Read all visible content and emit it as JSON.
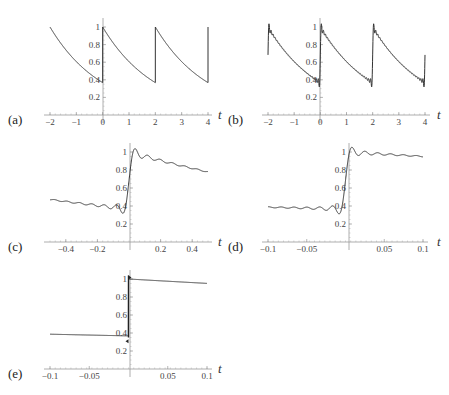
{
  "chart_data": [
    {
      "id": "a",
      "panel_label": "(a)",
      "type": "line",
      "title": "",
      "xlabel": "t",
      "ylabel": "",
      "xlim": [
        -2,
        4
      ],
      "ylim": [
        0,
        1.05
      ],
      "x_ticks": [
        "-2",
        "-1",
        "0",
        "1",
        "2",
        "3",
        "4"
      ],
      "y_ticks": [
        "0.2",
        "0.4",
        "0.6",
        "0.8",
        "1"
      ],
      "grid": false,
      "description": "Periodic sawtooth, period 2: y = exp(-(t mod 2)/2), jumps from ~0.37 to 1 at t=0 and t=2",
      "series": [
        {
          "name": "exact",
          "points": [
            [
              -2,
              1
            ],
            [
              -1,
              0.61
            ],
            [
              0,
              0.37
            ],
            [
              0,
              1
            ],
            [
              1,
              0.61
            ],
            [
              2,
              0.37
            ],
            [
              2,
              1
            ],
            [
              3,
              0.61
            ],
            [
              4,
              0.37
            ]
          ]
        }
      ]
    },
    {
      "id": "b",
      "panel_label": "(b)",
      "type": "line",
      "title": "",
      "xlabel": "t",
      "ylabel": "",
      "xlim": [
        -2,
        4
      ],
      "ylim": [
        0,
        1.05
      ],
      "x_ticks": [
        "-2",
        "-1",
        "0",
        "1",
        "2",
        "3",
        "4"
      ],
      "y_ticks": [
        "0.2",
        "0.4",
        "0.6",
        "0.8",
        "1"
      ],
      "grid": false,
      "description": "Fourier partial-sum approximation of (a) with Gibbs ringing near jumps; endpoints at t=-2 and t=4 near 0.68",
      "series": [
        {
          "name": "fourier",
          "points": [
            [
              -2,
              0.68
            ],
            [
              -1.95,
              1.03
            ],
            [
              -1,
              0.61
            ],
            [
              -0.05,
              0.34
            ],
            [
              0,
              0.68
            ],
            [
              0.05,
              1.03
            ],
            [
              1,
              0.61
            ],
            [
              1.95,
              0.34
            ],
            [
              2,
              0.68
            ],
            [
              2.05,
              1.03
            ],
            [
              3,
              0.61
            ],
            [
              3.95,
              0.34
            ],
            [
              4,
              0.68
            ]
          ]
        }
      ]
    },
    {
      "id": "c",
      "panel_label": "(c)",
      "type": "line",
      "title": "",
      "xlabel": "t",
      "ylabel": "",
      "xlim": [
        -0.5,
        0.5
      ],
      "ylim": [
        0,
        1.05
      ],
      "x_ticks": [
        "-0.4",
        "-0.2",
        "0.2",
        "0.4"
      ],
      "y_ticks": [
        "0.2",
        "0.4",
        "0.6",
        "0.8",
        "1"
      ],
      "grid": false,
      "description": "Zoom near jump at t=0 showing Gibbs oscillation",
      "series": [
        {
          "name": "fourier",
          "points": [
            [
              -0.5,
              0.48
            ],
            [
              -0.3,
              0.45
            ],
            [
              -0.1,
              0.41
            ],
            [
              -0.04,
              0.34
            ],
            [
              0,
              0.68
            ],
            [
              0.04,
              1.03
            ],
            [
              0.1,
              0.93
            ],
            [
              0.2,
              0.91
            ],
            [
              0.3,
              0.87
            ],
            [
              0.5,
              0.79
            ]
          ]
        }
      ]
    },
    {
      "id": "d",
      "panel_label": "(d)",
      "type": "line",
      "title": "",
      "xlabel": "t",
      "ylabel": "",
      "xlim": [
        -0.1,
        0.1
      ],
      "ylim": [
        0,
        1.05
      ],
      "x_ticks": [
        "-0.1",
        "-0.05",
        "0.05",
        "0.1"
      ],
      "y_ticks": [
        "0.2",
        "0.4",
        "0.6",
        "0.8",
        "1"
      ],
      "grid": false,
      "description": "Further zoom near t=0 with higher-order partial sum",
      "series": [
        {
          "name": "fourier",
          "points": [
            [
              -0.1,
              0.39
            ],
            [
              -0.05,
              0.38
            ],
            [
              -0.01,
              0.37
            ],
            [
              -0.004,
              0.31
            ],
            [
              0,
              0.68
            ],
            [
              0.004,
              1.04
            ],
            [
              0.02,
              0.99
            ],
            [
              0.05,
              0.98
            ],
            [
              0.1,
              0.95
            ]
          ]
        }
      ]
    },
    {
      "id": "e",
      "panel_label": "(e)",
      "type": "line",
      "title": "",
      "xlabel": "t",
      "ylabel": "",
      "xlim": [
        -0.1,
        0.1
      ],
      "ylim": [
        0,
        1.05
      ],
      "x_ticks": [
        "-0.1",
        "-0.05",
        "0.05",
        "0.1"
      ],
      "y_ticks": [
        "0.2",
        "0.4",
        "0.6",
        "0.8",
        "1"
      ],
      "grid": false,
      "description": "Very high-order partial sum; near-vertical jump at t=0 from ~0.37 to ~1",
      "series": [
        {
          "name": "fourier",
          "points": [
            [
              -0.1,
              0.39
            ],
            [
              0,
              0.37
            ],
            [
              0,
              1.0
            ],
            [
              0.1,
              0.95
            ]
          ]
        }
      ]
    }
  ]
}
